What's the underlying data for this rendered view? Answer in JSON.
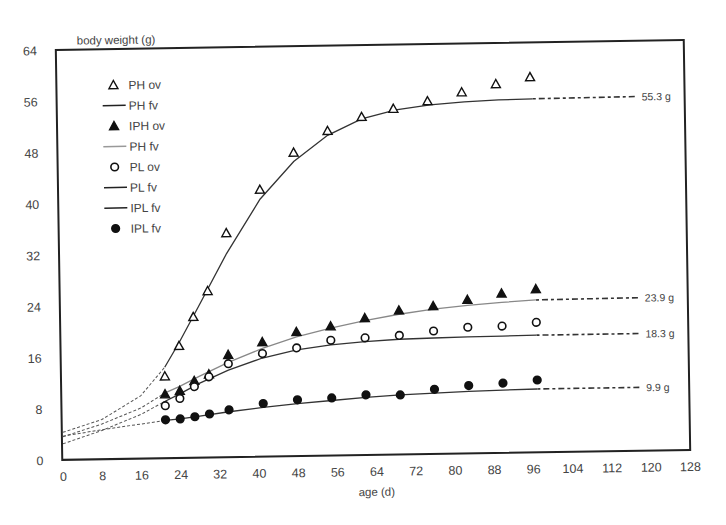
{
  "chart_data": {
    "type": "scatter",
    "title": "",
    "ylabel": "body weight (g)",
    "xlabel": "age (d)",
    "xlim": [
      0,
      128
    ],
    "ylim": [
      0,
      64
    ],
    "xticks": [
      0,
      8,
      16,
      24,
      32,
      40,
      48,
      56,
      64,
      72,
      80,
      88,
      96,
      104,
      112,
      120,
      128
    ],
    "yticks": [
      0,
      8,
      16,
      24,
      32,
      40,
      48,
      56,
      64
    ],
    "grid": false,
    "legend_position": "upper-left (inside)",
    "legend": [
      {
        "label": "PH ov",
        "marker": "triangle-open"
      },
      {
        "label": "PH fv",
        "marker": "line-dark"
      },
      {
        "label": "IPH ov",
        "marker": "triangle-filled"
      },
      {
        "label": "PH fv",
        "marker": "line-gray"
      },
      {
        "label": "PL ov",
        "marker": "circle-open"
      },
      {
        "label": "PL fv",
        "marker": "line-dark"
      },
      {
        "label": "IPL fv",
        "marker": "line-dark"
      },
      {
        "label": "IPL fv",
        "marker": "circle-filled"
      }
    ],
    "series": [
      {
        "name": "PH ov",
        "marker": "triangle-open",
        "x": [
          21,
          24,
          27,
          30,
          34,
          41,
          48,
          55,
          62,
          68.5,
          75.5,
          82.5,
          89.5,
          96.5
        ],
        "y": [
          12.8,
          17.5,
          22,
          26,
          35,
          41.7,
          47.4,
          50.7,
          52.8,
          54,
          55.1,
          56.4,
          57.6,
          58.6
        ]
      },
      {
        "name": "IPH ov",
        "marker": "triangle-filled",
        "x": [
          21,
          24,
          27,
          30,
          34,
          41,
          48,
          55,
          62,
          69,
          76,
          83,
          90,
          97
        ],
        "y": [
          10,
          10.5,
          12,
          13,
          16,
          17.9,
          19.4,
          20.2,
          21.4,
          22.5,
          23.1,
          24,
          24.9,
          25.5
        ]
      },
      {
        "name": "PL ov",
        "marker": "circle-open",
        "x": [
          21,
          24,
          27,
          30,
          34,
          41,
          48,
          55,
          62,
          69,
          76,
          83,
          90,
          97
        ],
        "y": [
          8.2,
          9.3,
          11.1,
          12.6,
          14.6,
          16.1,
          16.9,
          18,
          18.3,
          18.6,
          19.2,
          19.7,
          19.8,
          20.3
        ]
      },
      {
        "name": "IPL ov",
        "marker": "circle-filled",
        "x": [
          21,
          24,
          27,
          30,
          34,
          41,
          48,
          55,
          62,
          69,
          76,
          83,
          90,
          97
        ],
        "y": [
          6,
          6.1,
          6.4,
          6.8,
          7.4,
          8.3,
          8.8,
          9,
          9.4,
          9.3,
          10.1,
          10.6,
          10.9,
          11.3
        ]
      }
    ],
    "fitted_curves": [
      {
        "name": "PH fv",
        "color": "#333333",
        "asymptote": 55.3,
        "x0_value": 4.3,
        "x": [
          0,
          8,
          16,
          21,
          24,
          28,
          34,
          41,
          48,
          55,
          62,
          69,
          76,
          83,
          90,
          97
        ],
        "y": [
          4.3,
          6.2,
          9.8,
          14.2,
          18,
          23.5,
          31.8,
          40.2,
          46,
          50,
          52.5,
          53.8,
          54.5,
          54.9,
          55.1,
          55.2
        ]
      },
      {
        "name": "IPH fv",
        "color": "#888888",
        "asymptote": 23.9,
        "x0_value": 3.6,
        "x": [
          0,
          8,
          16,
          21,
          24,
          28,
          34,
          41,
          48,
          55,
          62,
          69,
          76,
          83,
          90,
          97
        ],
        "y": [
          3.6,
          5.5,
          7.9,
          10.2,
          11.2,
          12.7,
          14.8,
          16.9,
          18.6,
          19.9,
          21,
          21.9,
          22.6,
          23.1,
          23.5,
          23.8
        ]
      },
      {
        "name": "PL fv",
        "color": "#333333",
        "asymptote": 18.3,
        "x0_value": 2.5,
        "x": [
          0,
          8,
          16,
          21,
          24,
          28,
          34,
          41,
          48,
          55,
          62,
          69,
          76,
          83,
          90,
          97
        ],
        "y": [
          2.5,
          4.5,
          6.9,
          8.9,
          10,
          11.6,
          13.6,
          15.4,
          16.6,
          17.3,
          17.7,
          18,
          18.1,
          18.2,
          18.25,
          18.3
        ]
      },
      {
        "name": "IPL fv",
        "color": "#333333",
        "asymptote": 9.9,
        "x0_value": 3.7,
        "x": [
          0,
          8,
          16,
          21,
          24,
          28,
          34,
          41,
          48,
          55,
          62,
          69,
          76,
          83,
          90,
          97
        ],
        "y": [
          3.7,
          4.6,
          5.4,
          5.9,
          6.1,
          6.5,
          7.1,
          7.7,
          8.2,
          8.6,
          9,
          9.3,
          9.5,
          9.7,
          9.8,
          9.9
        ]
      }
    ],
    "annotations": [
      {
        "text": "55.3 g",
        "y": 55.3
      },
      {
        "text": "23.9 g",
        "y": 23.9
      },
      {
        "text": "18.3 g",
        "y": 18.3
      },
      {
        "text": "9.9 g",
        "y": 9.9
      }
    ]
  },
  "labels": {
    "ylabel": "body weight (g)",
    "xlabel": "age (d)"
  }
}
